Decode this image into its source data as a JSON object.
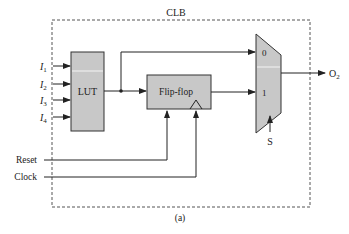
{
  "diagram": {
    "title": "CLB",
    "caption": "(a)",
    "blocks": {
      "lut": {
        "label": "LUT"
      },
      "flipflop": {
        "label": "Flip-flop"
      },
      "mux": {
        "input0": "0",
        "input1": "1"
      }
    },
    "inputs": [
      {
        "name": "I",
        "sub": "1"
      },
      {
        "name": "I",
        "sub": "2"
      },
      {
        "name": "I",
        "sub": "3"
      },
      {
        "name": "I",
        "sub": "4"
      }
    ],
    "signals": {
      "reset": "Reset",
      "clock": "Clock",
      "select": "S",
      "output": {
        "name": "O",
        "sub": "2"
      }
    },
    "colors": {
      "block_fill": "#c8c8c8",
      "stroke": "#333333",
      "dashed_border": "#555555"
    }
  }
}
